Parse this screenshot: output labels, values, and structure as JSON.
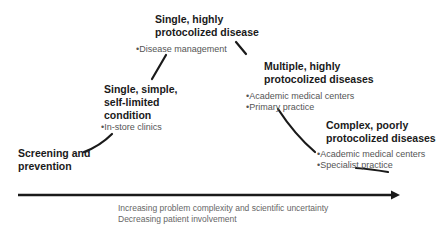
{
  "stages": [
    {
      "id": "screening",
      "heading": [
        "Screening and",
        "prevention"
      ],
      "bullets": []
    },
    {
      "id": "single-simple",
      "heading": [
        "Single, simple,",
        "self-limited",
        "condition"
      ],
      "bullets": [
        "In-store clinics"
      ]
    },
    {
      "id": "single-highly",
      "heading": [
        "Single, highly",
        "protocolized disease"
      ],
      "bullets": [
        "Disease management"
      ]
    },
    {
      "id": "multiple-highly",
      "heading": [
        "Multiple, highly",
        "protocolized diseases"
      ],
      "bullets": [
        "Academic medical centers",
        "Primary practice"
      ]
    },
    {
      "id": "complex-poorly",
      "heading": [
        "Complex, poorly",
        "protocolized diseases"
      ],
      "bullets": [
        "Academic medical centers",
        "Specialist practice"
      ]
    }
  ],
  "axis": {
    "label_line1": "Increasing problem complexity and scientific uncertainty",
    "label_line2": "Decreasing patient involvement"
  },
  "colors": {
    "line": "#1a1a1a",
    "heading": "#1a1a1a",
    "bullet": "#555555",
    "axis_label": "#666666"
  }
}
